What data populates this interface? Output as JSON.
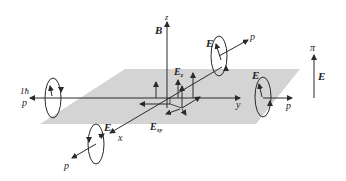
{
  "diagram": {
    "colors": {
      "plane": "#d4d4d4",
      "lines": "#2a2a2a",
      "background": "#ffffff"
    },
    "axes": {
      "z_label": "z",
      "y_label": "y",
      "x_label": "x"
    },
    "labels": {
      "B": "B",
      "E_top": "E",
      "p_top": "p",
      "E_right_ring": "E",
      "p_right": "p",
      "E_front": "E",
      "p_front": "p",
      "hbar": "1ħ",
      "p_left": "p",
      "E_z": "E",
      "E_z_sub": "z",
      "E_xy": "E",
      "E_xy_sub": "xy",
      "pi": "π",
      "E_pi": "E"
    }
  }
}
